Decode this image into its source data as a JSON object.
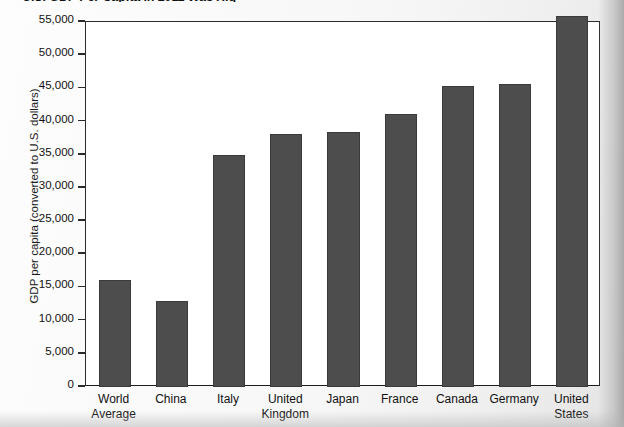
{
  "chart_data": {
    "type": "bar",
    "title": "U.S. GDP Per Capita in 2011 Was Hig",
    "title_note": "title is clipped by the top edge of the scan",
    "xlabel": "",
    "ylabel": "GDP per capita (converted to U.S. dollars)",
    "categories": [
      "World\nAverage",
      "China",
      "Italy",
      "United\nKingdom",
      "Japan",
      "France",
      "Canada",
      "Germany",
      "United\nStates"
    ],
    "values": [
      16100,
      13000,
      34900,
      38100,
      38400,
      41100,
      45400,
      45700,
      55900
    ],
    "ylim": [
      0,
      55000
    ],
    "ytick_values": [
      0,
      5000,
      10000,
      15000,
      20000,
      25000,
      30000,
      35000,
      40000,
      45000,
      50000,
      55000
    ],
    "ytick_labels": [
      "0",
      "5,000",
      "10,000",
      "15,000",
      "20,000",
      "25,000",
      "30,000",
      "35,000",
      "40,000",
      "45,000",
      "50,000",
      "55,000"
    ],
    "grid": false,
    "legend": false,
    "bar_color": "#4d4d4d",
    "plot_background": "#ffffff",
    "axis_color": "#2b2b2b"
  },
  "caption": {
    "bottom_partial": ""
  }
}
